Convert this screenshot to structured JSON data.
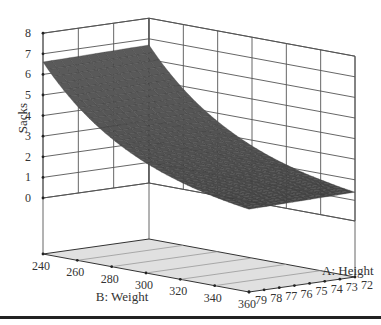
{
  "chart_data": {
    "type": "surface",
    "title": "",
    "zlabel": "Sacks",
    "xlabel": "B: Weight",
    "ylabel": "A: Height",
    "z_ticks": [
      0,
      1,
      2,
      3,
      4,
      5,
      6,
      7,
      8
    ],
    "x_ticks": [
      240,
      260,
      280,
      300,
      320,
      340,
      360
    ],
    "y_ticks": [
      72,
      73,
      74,
      75,
      76,
      77,
      78,
      79
    ],
    "zlim": [
      0,
      8
    ],
    "xlim": [
      240,
      360
    ],
    "ylim": [
      72,
      79
    ],
    "grid": true,
    "surface_corners": [
      {
        "weight": 240,
        "height": 79,
        "sacks": 6.6
      },
      {
        "weight": 240,
        "height": 72,
        "sacks": 6.7
      },
      {
        "weight": 360,
        "height": 72,
        "sacks": 1.4
      },
      {
        "weight": 360,
        "height": 79,
        "sacks": 1.3
      }
    ],
    "surface_note": "Sacks decreases with Weight, nearly flat across Height; convex curvature",
    "surface_color": "#4a4a4a",
    "floor_color": "#e0e0e0"
  }
}
